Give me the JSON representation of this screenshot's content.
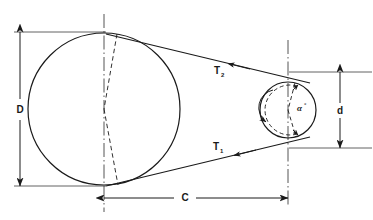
{
  "figure": {
    "kind": "engineering-diagram",
    "background_color": "#ffffff",
    "line_color": "#1a1a1a"
  },
  "labels": {
    "large_pulley_diameter": "D",
    "small_pulley_diameter": "d",
    "center_distance": "C",
    "tight_side_tension": "T",
    "tight_side_tension_subscript": "2",
    "slack_side_tension": "T",
    "slack_side_tension_subscript": "1",
    "wrap_angle": "α",
    "wrap_angle_unit": "°"
  },
  "geometry": {
    "large_pulley": {
      "center_x": 104,
      "center_y": 109,
      "radius": 76,
      "centerline_x": 104
    },
    "small_pulley": {
      "center_x": 288,
      "center_y": 110,
      "radius": 28,
      "centerline_x": 288
    },
    "dimension_D": {
      "x": 20,
      "y_top": 32,
      "y_bottom": 186
    },
    "dimension_d": {
      "x": 340,
      "y_top": 72,
      "y_bottom": 148
    },
    "dimension_C": {
      "y": 198,
      "x_left": 104,
      "x_right": 288
    }
  },
  "annotations": {
    "rotation_direction": "counter-clockwise",
    "belt_type": "open belt",
    "tight_side_arrow_direction": "right-to-left-toward-small-pulley",
    "slack_side_arrow_direction": "right-to-left-toward-large-pulley"
  }
}
